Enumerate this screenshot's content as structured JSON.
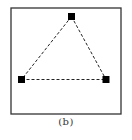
{
  "figure": {
    "caption": "(b)",
    "frame_color": "#333333",
    "node_color": "#000000",
    "edge_color": "#222222",
    "edge_style": "dashed"
  },
  "diagram": {
    "nodes": [
      {
        "id": "top",
        "label": ""
      },
      {
        "id": "bottom-left",
        "label": ""
      },
      {
        "id": "bottom-right",
        "label": ""
      }
    ],
    "edges": [
      {
        "from": "top",
        "to": "bottom-left"
      },
      {
        "from": "top",
        "to": "bottom-right"
      },
      {
        "from": "bottom-left",
        "to": "bottom-right"
      }
    ]
  }
}
